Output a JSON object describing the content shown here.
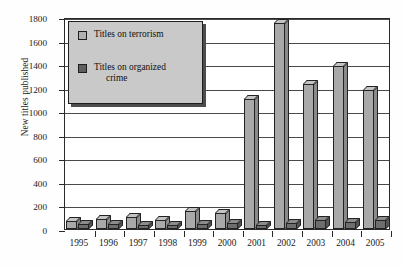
{
  "chart_data": {
    "type": "bar",
    "title": "",
    "subtitle": "",
    "xlabel": "",
    "ylabel": "New titles published",
    "ylim": [
      0,
      1800
    ],
    "ytick_step": 200,
    "yticks": [
      0,
      200,
      400,
      600,
      800,
      1000,
      1200,
      1400,
      1600,
      1800
    ],
    "ytick_labels": [
      "0",
      "200",
      "400",
      "600",
      "800",
      "1000",
      "1200",
      "1400",
      "1600",
      "1800"
    ],
    "categories": [
      "1995",
      "1996",
      "1997",
      "1998",
      "1999",
      "2000",
      "2001",
      "2002",
      "2003",
      "2004",
      "2005"
    ],
    "grid": true,
    "grid_axis": "y",
    "legend_position": "upper-left",
    "style": "3d-column",
    "series": [
      {
        "name": "Titles on terrorism",
        "color": "#a9a9a9",
        "values": [
          70,
          85,
          105,
          80,
          150,
          135,
          1100,
          1750,
          1230,
          1380,
          1180
        ]
      },
      {
        "name": "Titles on organized crime",
        "color": "#6e6e6e",
        "values": [
          40,
          40,
          35,
          35,
          45,
          50,
          35,
          55,
          75,
          60,
          75
        ]
      }
    ]
  },
  "axis": {
    "y_title": "New titles published"
  },
  "legend": {
    "entries": [
      {
        "label": "Titles on terrorism",
        "label_line1": "Titles on terrorism",
        "label_line2": "",
        "swatch": "light"
      },
      {
        "label": "Titles on organized crime",
        "label_line1": "Titles on organized",
        "label_line2": "crime",
        "swatch": "dark"
      }
    ]
  },
  "icons": {
    "legend_swatch_light": "legend-swatch-light-icon",
    "legend_swatch_dark": "legend-swatch-dark-icon"
  }
}
